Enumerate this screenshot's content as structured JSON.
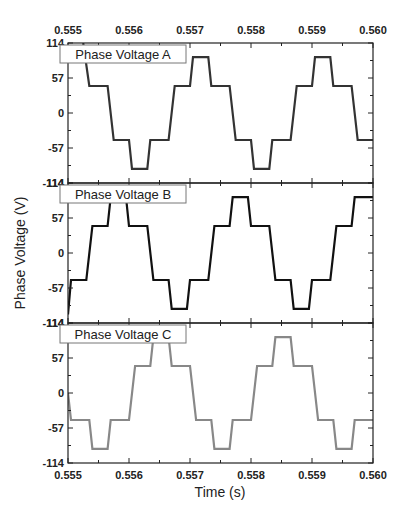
{
  "chart_data": {
    "type": "line",
    "title": "",
    "xlabel": "Time (s)",
    "ylabel": "Phase Voltage (V)",
    "xlim": [
      0.555,
      0.56
    ],
    "x_ticks": [
      "0.555",
      "0.556",
      "0.557",
      "0.558",
      "0.559",
      "0.560"
    ],
    "y_ticks": [
      "114",
      "57",
      "0",
      "-57",
      "-114"
    ],
    "grid": false,
    "panels": [
      {
        "name": "Phase Voltage A",
        "legend": "Phase Voltage A",
        "color": "#333333",
        "ylim": [
          -114,
          114
        ],
        "x": [
          0.5553,
          0.5553,
          0.5554,
          0.5555,
          0.5555,
          0.5556,
          0.5556,
          0.5557,
          0.5557,
          0.5558,
          0.5558,
          0.5559,
          0.5559,
          0.556,
          0.556,
          0.5561,
          0.5561,
          0.5562,
          0.5562,
          0.5563,
          0.5563,
          0.5564,
          0.5564,
          0.5565,
          0.5565,
          0.5566,
          0.5566,
          0.5567,
          0.5567,
          0.5568,
          0.5568,
          0.5569,
          0.5569,
          0.557,
          0.557,
          0.5571,
          0.5571,
          0.5572,
          0.5572,
          0.5573,
          0.5573,
          0.5574,
          0.5574,
          0.5575,
          0.5575,
          0.5576,
          0.5576,
          0.5577,
          0.5577,
          0.5578,
          0.5578,
          0.5579,
          0.5579,
          0.558,
          0.558,
          0.5581,
          0.5581,
          0.5582,
          0.5582,
          0.5583,
          0.5583,
          0.5584,
          0.5584,
          0.5585,
          0.5585,
          0.5586,
          0.5586,
          0.5587,
          0.5587,
          0.5588,
          0.5588,
          0.5589,
          0.5589,
          0.559,
          0.559,
          0.5591,
          0.5591,
          0.5592,
          0.5592,
          0.5593,
          0.5593,
          0.5594,
          0.5594,
          0.5595,
          0.5595,
          0.5596,
          0.5596,
          0.5597,
          0.5597,
          0.5598,
          0.5598
        ],
        "y": [
          114,
          44,
          44,
          44,
          44,
          44,
          44,
          44,
          44,
          -44,
          -44,
          -44,
          -44,
          -44,
          -44,
          -91,
          -91,
          -91,
          -91,
          -91,
          -91,
          -44,
          -44,
          -44,
          -44,
          -44,
          -44,
          44,
          44,
          44,
          44,
          44,
          44,
          91,
          91,
          91,
          91,
          91,
          91,
          44,
          44,
          44,
          44,
          44,
          44,
          -44,
          -44,
          -44,
          -44,
          -44,
          -44,
          -91,
          -91,
          -91,
          -91,
          -91,
          -91,
          -44,
          -44,
          -44,
          -44,
          -44,
          -44,
          44,
          44,
          44,
          44,
          44,
          44,
          91,
          91,
          91,
          91,
          91,
          91,
          44,
          44,
          44,
          44,
          44,
          44,
          -44,
          -44,
          -44,
          -44,
          -44,
          -44,
          -44,
          -44,
          -44,
          -44
        ],
        "breakpoints": [
          {
            "t": 0.55525,
            "v": 114
          },
          {
            "t": 0.55535,
            "v": 44
          },
          {
            "t": 0.55565,
            "v": 44
          },
          {
            "t": 0.55575,
            "v": -44
          },
          {
            "t": 0.556,
            "v": -44
          },
          {
            "t": 0.55605,
            "v": -91
          },
          {
            "t": 0.5563,
            "v": -91
          },
          {
            "t": 0.55635,
            "v": -44
          },
          {
            "t": 0.55665,
            "v": -44
          },
          {
            "t": 0.55675,
            "v": 44
          },
          {
            "t": 0.557,
            "v": 44
          },
          {
            "t": 0.55705,
            "v": 91
          },
          {
            "t": 0.5573,
            "v": 91
          },
          {
            "t": 0.55735,
            "v": 44
          },
          {
            "t": 0.55765,
            "v": 44
          },
          {
            "t": 0.55775,
            "v": -44
          },
          {
            "t": 0.558,
            "v": -44
          },
          {
            "t": 0.55805,
            "v": -91
          },
          {
            "t": 0.5583,
            "v": -91
          },
          {
            "t": 0.55835,
            "v": -44
          },
          {
            "t": 0.55865,
            "v": -44
          },
          {
            "t": 0.55875,
            "v": 44
          },
          {
            "t": 0.559,
            "v": 44
          },
          {
            "t": 0.55905,
            "v": 91
          },
          {
            "t": 0.5593,
            "v": 91
          },
          {
            "t": 0.55935,
            "v": 44
          },
          {
            "t": 0.55965,
            "v": 44
          },
          {
            "t": 0.55975,
            "v": -44
          },
          {
            "t": 0.56,
            "v": -44
          }
        ]
      },
      {
        "name": "Phase Voltage B",
        "legend": "Phase Voltage B",
        "color": "#111111",
        "ylim": [
          -114,
          114
        ],
        "breakpoints": [
          {
            "t": 0.555,
            "v": -100
          },
          {
            "t": 0.55505,
            "v": -44
          },
          {
            "t": 0.5553,
            "v": -44
          },
          {
            "t": 0.5554,
            "v": 44
          },
          {
            "t": 0.55565,
            "v": 44
          },
          {
            "t": 0.5557,
            "v": 91
          },
          {
            "t": 0.55595,
            "v": 91
          },
          {
            "t": 0.556,
            "v": 44
          },
          {
            "t": 0.5563,
            "v": 44
          },
          {
            "t": 0.5564,
            "v": -44
          },
          {
            "t": 0.55665,
            "v": -44
          },
          {
            "t": 0.5567,
            "v": -91
          },
          {
            "t": 0.55695,
            "v": -91
          },
          {
            "t": 0.557,
            "v": -44
          },
          {
            "t": 0.5573,
            "v": -44
          },
          {
            "t": 0.5574,
            "v": 44
          },
          {
            "t": 0.55765,
            "v": 44
          },
          {
            "t": 0.5577,
            "v": 91
          },
          {
            "t": 0.55795,
            "v": 91
          },
          {
            "t": 0.558,
            "v": 44
          },
          {
            "t": 0.5583,
            "v": 44
          },
          {
            "t": 0.5584,
            "v": -44
          },
          {
            "t": 0.55865,
            "v": -44
          },
          {
            "t": 0.5587,
            "v": -91
          },
          {
            "t": 0.55895,
            "v": -91
          },
          {
            "t": 0.559,
            "v": -44
          },
          {
            "t": 0.5593,
            "v": -44
          },
          {
            "t": 0.5594,
            "v": 44
          },
          {
            "t": 0.55965,
            "v": 44
          },
          {
            "t": 0.5597,
            "v": 91
          },
          {
            "t": 0.56,
            "v": 91
          }
        ]
      },
      {
        "name": "Phase Voltage C",
        "legend": "Phase Voltage C",
        "color": "#888888",
        "ylim": [
          -114,
          114
        ],
        "breakpoints": [
          {
            "t": 0.555,
            "v": 0
          },
          {
            "t": 0.55505,
            "v": -44
          },
          {
            "t": 0.55535,
            "v": -44
          },
          {
            "t": 0.5554,
            "v": -91
          },
          {
            "t": 0.55565,
            "v": -91
          },
          {
            "t": 0.5557,
            "v": -44
          },
          {
            "t": 0.556,
            "v": -44
          },
          {
            "t": 0.5561,
            "v": 44
          },
          {
            "t": 0.55635,
            "v": 44
          },
          {
            "t": 0.5564,
            "v": 91
          },
          {
            "t": 0.55665,
            "v": 91
          },
          {
            "t": 0.5567,
            "v": 44
          },
          {
            "t": 0.557,
            "v": 44
          },
          {
            "t": 0.5571,
            "v": -44
          },
          {
            "t": 0.55735,
            "v": -44
          },
          {
            "t": 0.5574,
            "v": -91
          },
          {
            "t": 0.55765,
            "v": -91
          },
          {
            "t": 0.5577,
            "v": -44
          },
          {
            "t": 0.558,
            "v": -44
          },
          {
            "t": 0.5581,
            "v": 44
          },
          {
            "t": 0.55835,
            "v": 44
          },
          {
            "t": 0.5584,
            "v": 91
          },
          {
            "t": 0.55865,
            "v": 91
          },
          {
            "t": 0.5587,
            "v": 44
          },
          {
            "t": 0.559,
            "v": 44
          },
          {
            "t": 0.5591,
            "v": -44
          },
          {
            "t": 0.55935,
            "v": -44
          },
          {
            "t": 0.5594,
            "v": -91
          },
          {
            "t": 0.55965,
            "v": -91
          },
          {
            "t": 0.5597,
            "v": -44
          },
          {
            "t": 0.56,
            "v": -44
          }
        ]
      }
    ]
  }
}
